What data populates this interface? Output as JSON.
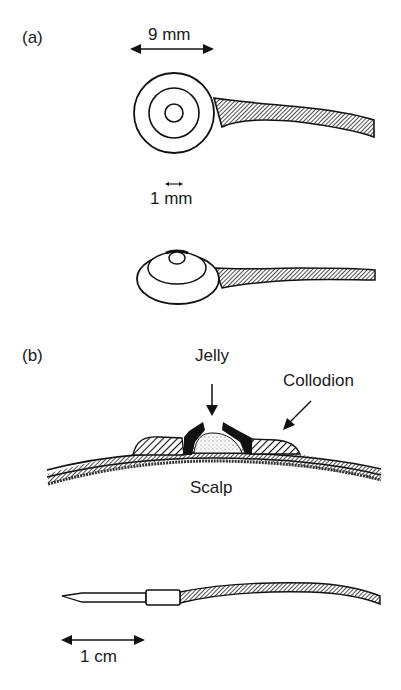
{
  "panels": {
    "a": {
      "label": "(a)",
      "dimension_top": "9 mm",
      "dimension_hole": "1 mm"
    },
    "b": {
      "label": "(b)",
      "jelly": "Jelly",
      "collodion": "Collodion",
      "scalp": "Scalp",
      "scale": "1 cm"
    }
  }
}
